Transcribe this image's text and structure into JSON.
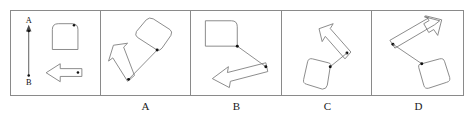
{
  "figure": {
    "type": "mental-rotation-multiple-choice",
    "panel_count": 5,
    "stroke_color": "#7d7d7d",
    "dot_color": "#111111",
    "background_color": "#ffffff",
    "border_color": "#8a8a8a"
  },
  "reference_panel": {
    "name": "reference",
    "axis": {
      "top_label": "A",
      "bottom_label": "B",
      "direction": "vertical",
      "arrowhead_at": "top"
    },
    "objects": [
      {
        "id": "rounded-square",
        "shape": "rounded-square",
        "position": "upper-right",
        "rotation_deg": 0,
        "marker_dot": "top-right-corner"
      },
      {
        "id": "block-arrow",
        "shape": "block-arrow",
        "position": "lower-right",
        "pointing": "left",
        "rotation_deg": 180,
        "marker_dot": "tail-right"
      }
    ]
  },
  "options": [
    {
      "label": "A",
      "name": "option-a",
      "square": {
        "position": "upper-right",
        "rotation_deg": 40,
        "marker_dot": "bottom-vertex"
      },
      "arrow": {
        "position": "lower-left",
        "pointing": "up-left",
        "rotation_deg": 215,
        "marker_dot": "tail"
      },
      "connector": "square-dot to arrow-dot"
    },
    {
      "label": "B",
      "name": "option-b",
      "square": {
        "position": "upper-left",
        "rotation_deg": 0,
        "marker_dot": "bottom-right-corner"
      },
      "arrow": {
        "position": "lower-right",
        "pointing": "down-left",
        "rotation_deg": 200,
        "marker_dot": "tail"
      },
      "connector": "square-dot to arrow-dot"
    },
    {
      "label": "C",
      "name": "option-c",
      "square": {
        "position": "lower-left",
        "rotation_deg": 25,
        "marker_dot": "upper-right-corner"
      },
      "arrow": {
        "position": "upper-right",
        "pointing": "up-left",
        "rotation_deg": 150,
        "marker_dot": "tail"
      },
      "connector": "square-dot to arrow-dot"
    },
    {
      "label": "D",
      "name": "option-d",
      "square": {
        "position": "lower-right",
        "rotation_deg": 20,
        "marker_dot": "top-left-corner"
      },
      "arrow": {
        "position": "upper-left",
        "pointing": "up-right",
        "rotation_deg": 35,
        "marker_dot": "tail"
      },
      "connector": "square-dot to arrow-dot"
    }
  ],
  "labels": {
    "reference": "",
    "a": "A",
    "b": "B",
    "c": "C",
    "d": "D"
  }
}
